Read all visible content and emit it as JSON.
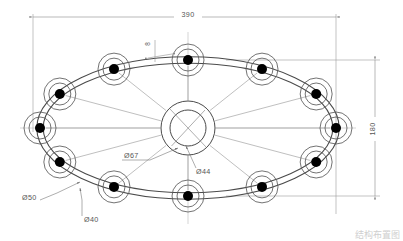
{
  "drawing": {
    "title_block": {
      "caption": "结构布置图"
    },
    "dimensions": {
      "overall_width": "390",
      "overall_height": "180",
      "node_outer_dia": "Ø50",
      "node_inner_dia": "Ø40",
      "hub_outer_dia": "Ø67",
      "hub_inner_dia": "Ø44",
      "track_width": "8"
    },
    "colors": {
      "line": "#4a4a4a",
      "thin_line": "#7a7a7a",
      "dim_line": "#8a8a8a",
      "node_fill": "#000000",
      "background": "#ffffff",
      "text": "#555555"
    },
    "geometry": {
      "center_x": 188,
      "center_y": 128,
      "ring_rx": 148,
      "ring_ry": 68,
      "node_count": 12,
      "node_outer_r": 16,
      "node_inner_r": 11,
      "node_dot_r": 5,
      "hub_outer_r": 27,
      "hub_inner_r": 18,
      "track_offset": 3.2
    },
    "nodes": [
      {
        "index": 1,
        "angle_deg": 0,
        "label": "node-e"
      },
      {
        "index": 2,
        "angle_deg": 30,
        "label": "node-ene"
      },
      {
        "index": 3,
        "angle_deg": 60,
        "label": "node-nne"
      },
      {
        "index": 4,
        "angle_deg": 90,
        "label": "node-n"
      },
      {
        "index": 5,
        "angle_deg": 120,
        "label": "node-nnw"
      },
      {
        "index": 6,
        "angle_deg": 150,
        "label": "node-wnw"
      },
      {
        "index": 7,
        "angle_deg": 180,
        "label": "node-w"
      },
      {
        "index": 8,
        "angle_deg": 210,
        "label": "node-wsw"
      },
      {
        "index": 9,
        "angle_deg": 240,
        "label": "node-ssw"
      },
      {
        "index": 10,
        "angle_deg": 270,
        "label": "node-s"
      },
      {
        "index": 11,
        "angle_deg": 300,
        "label": "node-sse"
      },
      {
        "index": 12,
        "angle_deg": 330,
        "label": "node-ese"
      }
    ]
  }
}
